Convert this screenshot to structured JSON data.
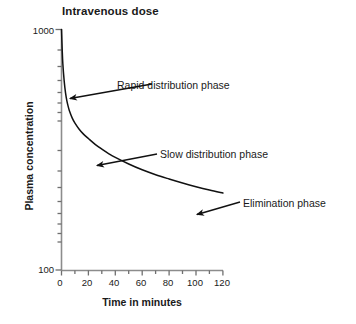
{
  "chart_data": {
    "type": "line",
    "title": "Intravenous dose",
    "xlabel": "Time in minutes",
    "ylabel": "Plasma concentration",
    "yscale": "log",
    "ylim": [
      100,
      1000
    ],
    "xlim": [
      0,
      120
    ],
    "grid": false,
    "legend": null,
    "ytick_labels": [
      "1000",
      "100"
    ],
    "ytick_values": [
      1000,
      100
    ],
    "xtick_labels": [
      "0",
      "20",
      "40",
      "60",
      "80",
      "100",
      "120"
    ],
    "xtick_values": [
      0,
      20,
      40,
      60,
      80,
      100,
      120
    ],
    "x_minor_step": 10,
    "series": [
      {
        "name": "Plasma concentration",
        "x": [
          0,
          0.5,
          1,
          2,
          3,
          4,
          5,
          6,
          8,
          10,
          13,
          16,
          20,
          25,
          30,
          35,
          40,
          50,
          60,
          70,
          80,
          90,
          100,
          110,
          120
        ],
        "y": [
          1000,
          830,
          720,
          610,
          545,
          505,
          478,
          457,
          428,
          408,
          386,
          369,
          352,
          333,
          318,
          305,
          294,
          276,
          261,
          249,
          239,
          230,
          222,
          215,
          209
        ]
      }
    ],
    "annotations": [
      {
        "text": "Rapid distribution phase",
        "label_x": 117,
        "label_y": 79,
        "arrow_from_x": 152,
        "arrow_from_y": 84,
        "arrow_to_x": 69,
        "arrow_to_y": 99
      },
      {
        "text": "Slow distribution phase",
        "label_x": 160,
        "label_y": 148,
        "arrow_from_x": 157,
        "arrow_from_y": 154,
        "arrow_to_x": 96,
        "arrow_to_y": 166
      },
      {
        "text": "Elimination phase",
        "label_x": 243,
        "label_y": 197,
        "arrow_from_x": 240,
        "arrow_from_y": 202,
        "arrow_to_x": 196,
        "arrow_to_y": 215
      }
    ],
    "colors": {
      "curve": "#111111",
      "axis": "#8c8c8c",
      "text": "#1a1a1a",
      "background": "#ffffff",
      "arrow": "#111111"
    }
  }
}
